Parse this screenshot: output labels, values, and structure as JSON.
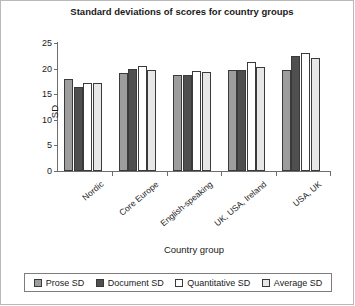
{
  "chart_data": {
    "type": "bar",
    "title": "Standard deviations of scores for country groups",
    "xlabel": "Country group",
    "ylabel": "SD",
    "ylim": [
      0,
      25
    ],
    "yticks": [
      0,
      5,
      10,
      15,
      20,
      25
    ],
    "grid": false,
    "legend_position": "bottom",
    "categories": [
      "Nordic",
      "Core Europe",
      "English-speaking",
      "UK, USA, Ireland",
      "USA, UK"
    ],
    "series": [
      {
        "name": "Prose SD",
        "color": "#9d9d9d",
        "values": [
          18.0,
          19.1,
          18.8,
          19.8,
          19.7
        ]
      },
      {
        "name": "Document SD",
        "color": "#4f4f4f",
        "values": [
          16.5,
          20.0,
          18.8,
          19.8,
          22.5
        ]
      },
      {
        "name": "Quantitative SD",
        "color": "#ffffff",
        "values": [
          17.1,
          20.5,
          19.5,
          21.3,
          23.0
        ]
      },
      {
        "name": "Average SD",
        "color": "#e7e7e7",
        "values": [
          17.2,
          19.8,
          19.3,
          20.3,
          22.0
        ]
      }
    ]
  },
  "legend": {
    "items": [
      {
        "label": "Prose SD"
      },
      {
        "label": "Document SD"
      },
      {
        "label": "Quantitative SD"
      },
      {
        "label": "Average SD"
      }
    ]
  }
}
